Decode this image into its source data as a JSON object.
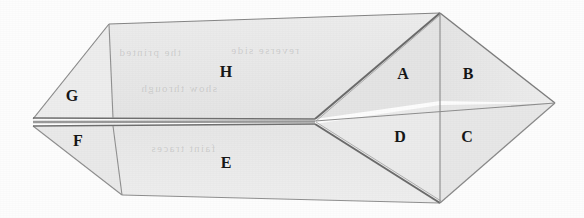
{
  "figure": {
    "kind": "geometric-solid-diagram",
    "canvas": {
      "width": 584,
      "height": 218
    },
    "colors": {
      "background": "#fdfdfd",
      "face_fill": "#e9e9e9",
      "face_fill_light": "#efefef",
      "face_fill_dark": "#e2e2e2",
      "stroke": "#7a7a7a",
      "stroke_dark": "#5d5d5d",
      "label_color": "#161616",
      "seam_band": "#8b8b8b"
    },
    "vertices": {
      "left_tip": [
        33,
        122
      ],
      "top_left": [
        109,
        24
      ],
      "bottom_left": [
        122,
        195
      ],
      "mid_junction": [
        315,
        121
      ],
      "top_apex": [
        440,
        13
      ],
      "bottom_apex": [
        440,
        203
      ],
      "right_tip": [
        555,
        103
      ],
      "upper_seam_left": [
        33,
        118
      ],
      "lower_seam_left": [
        33,
        126
      ]
    },
    "face_labels": [
      {
        "id": "A",
        "text": "A",
        "x": 403,
        "y": 74
      },
      {
        "id": "B",
        "text": "B",
        "x": 468,
        "y": 74
      },
      {
        "id": "C",
        "text": "C",
        "x": 467,
        "y": 137
      },
      {
        "id": "D",
        "text": "D",
        "x": 400,
        "y": 137
      },
      {
        "id": "E",
        "text": "E",
        "x": 226,
        "y": 163
      },
      {
        "id": "F",
        "text": "F",
        "x": 78,
        "y": 141
      },
      {
        "id": "G",
        "text": "G",
        "x": 72,
        "y": 96
      },
      {
        "id": "H",
        "text": "H",
        "x": 226,
        "y": 72
      }
    ],
    "ghost_marks": [
      {
        "text": "the printed",
        "x": 118,
        "y": 52
      },
      {
        "text": "reverse side",
        "x": 230,
        "y": 50
      },
      {
        "text": "show through",
        "x": 140,
        "y": 88
      },
      {
        "text": "faint traces",
        "x": 150,
        "y": 148
      }
    ]
  }
}
